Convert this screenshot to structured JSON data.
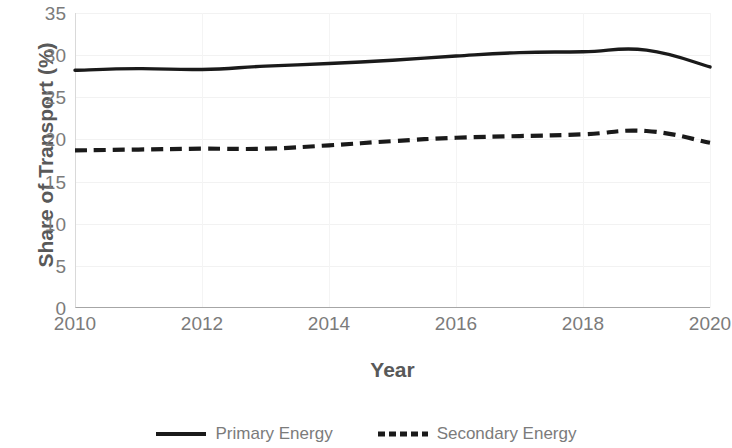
{
  "chart_data": {
    "type": "line",
    "title": "",
    "xlabel": "Year",
    "ylabel": "Share of Transport (%)",
    "x": [
      2010,
      2011,
      2012,
      2013,
      2014,
      2015,
      2016,
      2017,
      2018,
      2019,
      2020
    ],
    "xlim": [
      2010,
      2020
    ],
    "ylim": [
      0,
      35
    ],
    "y_ticks": [
      35,
      30,
      25,
      20,
      15,
      10,
      5,
      0
    ],
    "x_ticks": [
      2010,
      2012,
      2014,
      2016,
      2018,
      2020
    ],
    "grid": "both-faint",
    "legend_position": "bottom-center",
    "series": [
      {
        "name": "Primary Energy",
        "style": "solid",
        "color": "#000000",
        "values": [
          28.2,
          28.4,
          28.3,
          28.7,
          29.0,
          29.4,
          29.9,
          30.3,
          30.4,
          30.6,
          28.6
        ]
      },
      {
        "name": "Secondary Energy",
        "style": "dashed",
        "color": "#000000",
        "values": [
          18.7,
          18.8,
          18.9,
          18.9,
          19.3,
          19.8,
          20.2,
          20.4,
          20.6,
          21.0,
          19.6
        ]
      }
    ]
  },
  "axes": {
    "y_title": "Share of Transport (%)",
    "x_title": "Year",
    "y_tick_labels": [
      "35",
      "30",
      "25",
      "20",
      "15",
      "10",
      "5",
      "0"
    ],
    "x_tick_labels": [
      "2010",
      "2012",
      "2014",
      "2016",
      "2018",
      "2020"
    ]
  },
  "legend": {
    "entries": [
      {
        "label": "Primary Energy",
        "style": "solid"
      },
      {
        "label": "Secondary Energy",
        "style": "dashed"
      }
    ]
  },
  "colors": {
    "series_line": "#1a1a1a",
    "axis_text": "#7b7b7b",
    "title_text": "#595959",
    "gridline": "#f2f2f2",
    "axis_line": "#a6a6a6"
  }
}
